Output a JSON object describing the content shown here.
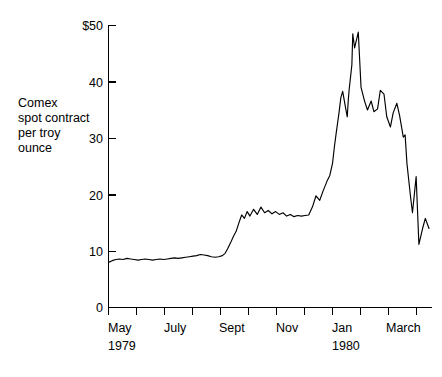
{
  "chart_data": {
    "type": "line",
    "title": "",
    "subtitle": "",
    "xlabel": "",
    "ylabel": "Comex spot contract per troy ounce",
    "ylabel_lines": [
      "Comex",
      "spot contract",
      "per troy",
      "ounce"
    ],
    "ylim": [
      0,
      50
    ],
    "yticks": [
      0,
      10,
      20,
      30,
      40,
      50
    ],
    "ytick_labels": [
      "0",
      "10",
      "20",
      "30",
      "40",
      "$50"
    ],
    "xlim": [
      "1979-05-01",
      "1980-04-15"
    ],
    "xticks": [
      "May",
      "June",
      "July",
      "Aug",
      "Sept",
      "Oct",
      "Nov",
      "Dec",
      "Jan",
      "Feb",
      "March",
      "April"
    ],
    "xtick_labels": [
      "May",
      "",
      "July",
      "",
      "Sept",
      "",
      "Nov",
      "",
      "Jan",
      "",
      "March",
      ""
    ],
    "xtick_sublabels": [
      "1979",
      "",
      "",
      "",
      "",
      "",
      "",
      "",
      "1980",
      "",
      "",
      ""
    ],
    "grid": false,
    "legend": false,
    "legend_position": "none",
    "series": [
      {
        "name": "Comex silver spot price (US$ per troy ounce)",
        "units": "USD per troy ounce",
        "x": [
          "1979-05-01",
          "1979-05-05",
          "1979-05-09",
          "1979-05-13",
          "1979-05-17",
          "1979-05-21",
          "1979-05-25",
          "1979-05-29",
          "1979-06-02",
          "1979-06-06",
          "1979-06-10",
          "1979-06-14",
          "1979-06-18",
          "1979-06-22",
          "1979-06-26",
          "1979-06-30",
          "1979-07-04",
          "1979-07-08",
          "1979-07-12",
          "1979-07-16",
          "1979-07-20",
          "1979-07-24",
          "1979-07-28",
          "1979-08-01",
          "1979-08-05",
          "1979-08-09",
          "1979-08-13",
          "1979-08-17",
          "1979-08-21",
          "1979-08-25",
          "1979-08-29",
          "1979-09-02",
          "1979-09-05",
          "1979-09-08",
          "1979-09-11",
          "1979-09-14",
          "1979-09-17",
          "1979-09-20",
          "1979-09-23",
          "1979-09-26",
          "1979-09-29",
          "1979-10-02",
          "1979-10-06",
          "1979-10-10",
          "1979-10-14",
          "1979-10-18",
          "1979-10-22",
          "1979-10-26",
          "1979-10-30",
          "1979-11-03",
          "1979-11-07",
          "1979-11-11",
          "1979-11-15",
          "1979-11-19",
          "1979-11-23",
          "1979-11-27",
          "1979-12-01",
          "1979-12-05",
          "1979-12-09",
          "1979-12-13",
          "1979-12-17",
          "1979-12-21",
          "1979-12-25",
          "1979-12-28",
          "1979-12-31",
          "1980-01-02",
          "1980-01-04",
          "1980-01-07",
          "1980-01-09",
          "1980-01-11",
          "1980-01-14",
          "1980-01-16",
          "1980-01-17",
          "1980-01-18",
          "1980-01-21",
          "1980-01-22",
          "1980-01-24",
          "1980-01-28",
          "1980-01-31",
          "1980-02-04",
          "1980-02-07",
          "1980-02-11",
          "1980-02-14",
          "1980-02-18",
          "1980-02-21",
          "1980-02-25",
          "1980-02-28",
          "1980-03-03",
          "1980-03-06",
          "1980-03-10",
          "1980-03-13",
          "1980-03-17",
          "1980-03-19",
          "1980-03-21",
          "1980-03-25",
          "1980-03-27",
          "1980-03-31",
          "1980-04-03",
          "1980-04-07",
          "1980-04-10",
          "1980-04-14"
        ],
        "values": [
          8.0,
          8.3,
          8.5,
          8.6,
          8.5,
          8.7,
          8.6,
          8.5,
          8.4,
          8.5,
          8.6,
          8.5,
          8.4,
          8.5,
          8.6,
          8.5,
          8.6,
          8.7,
          8.8,
          8.7,
          8.8,
          8.9,
          9.0,
          9.1,
          9.2,
          9.4,
          9.3,
          9.2,
          9.0,
          8.9,
          9.0,
          9.2,
          9.6,
          10.5,
          11.5,
          12.6,
          13.5,
          15.0,
          16.4,
          15.8,
          17.0,
          16.2,
          17.4,
          16.5,
          17.8,
          16.8,
          17.2,
          16.6,
          17.0,
          16.5,
          16.8,
          16.2,
          16.5,
          16.1,
          16.3,
          16.2,
          16.3,
          16.4,
          17.8,
          19.8,
          19.0,
          20.8,
          22.4,
          23.4,
          25.6,
          28.5,
          31.0,
          34.5,
          37.2,
          38.3,
          35.5,
          33.8,
          36.5,
          38.5,
          43.0,
          48.5,
          46.0,
          48.8,
          39.0,
          36.5,
          35.0,
          36.6,
          34.7,
          35.2,
          38.5,
          37.8,
          33.8,
          32.0,
          34.5,
          36.2,
          34.0,
          30.2,
          30.6,
          25.5,
          19.5,
          16.8,
          23.2,
          11.2,
          14.0,
          15.8,
          14.0
        ]
      }
    ],
    "annotations": [],
    "notable_points": [
      {
        "label": "starting level",
        "x": "1979-05-01",
        "y": 8.0
      },
      {
        "label": "autumn plateau",
        "x": "1979-10-15",
        "y": 16.5
      },
      {
        "label": "peak",
        "x": "1980-01-22",
        "y": 48.8
      },
      {
        "label": "crash low",
        "x": "1980-04-03",
        "y": 11.2
      },
      {
        "label": "final level",
        "x": "1980-04-14",
        "y": 14.0
      }
    ]
  },
  "axes": {
    "y_axis_caption_lines": [
      "Comex",
      "spot contract",
      "per troy",
      "ounce"
    ],
    "y_tick_labels": [
      "$50",
      "40",
      "30",
      "20",
      "10",
      "0"
    ],
    "x_tick_labels": [
      "May",
      "July",
      "Sept",
      "Nov",
      "Jan",
      "March"
    ],
    "x_year_labels": [
      "1979",
      "1980"
    ]
  },
  "colors": {
    "line": "#000000",
    "axis": "#000000",
    "background": "#ffffff",
    "text": "#000000"
  }
}
